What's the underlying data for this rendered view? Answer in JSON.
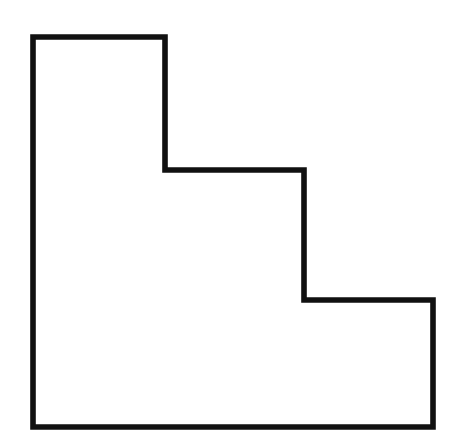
{
  "figure": {
    "name": "staircase-polygon",
    "shape_type": "polygon",
    "vertex_count": 8,
    "closed": true,
    "background_color": "#ffffff",
    "stroke_color": "#111111",
    "fill_color": "#ffffff",
    "stroke_width": 5.6,
    "canvas": {
      "width": 458,
      "height": 448
    },
    "vertices": [
      {
        "label": "top-left",
        "x": 33,
        "y": 37
      },
      {
        "label": "top-right",
        "x": 165,
        "y": 37
      },
      {
        "label": "step-1-inner",
        "x": 165,
        "y": 170
      },
      {
        "label": "step-1-right",
        "x": 304,
        "y": 170
      },
      {
        "label": "step-2-inner",
        "x": 304,
        "y": 300
      },
      {
        "label": "step-2-right",
        "x": 433,
        "y": 300
      },
      {
        "label": "bottom-right",
        "x": 433,
        "y": 427
      },
      {
        "label": "bottom-left",
        "x": 33,
        "y": 427
      }
    ],
    "path": "M 33 37 L 165 37 L 165 170 L 304 170 L 304 300 L 433 300 L 433 427 L 33 427 Z",
    "edges": [
      {
        "name": "top-edge",
        "orientation": "horizontal",
        "length": 132
      },
      {
        "name": "upper-right-edge",
        "orientation": "vertical",
        "length": 133
      },
      {
        "name": "step-1-tread",
        "orientation": "horizontal",
        "length": 139
      },
      {
        "name": "step-1-riser",
        "orientation": "vertical",
        "length": 130
      },
      {
        "name": "step-2-tread",
        "orientation": "horizontal",
        "length": 129
      },
      {
        "name": "step-2-riser",
        "orientation": "vertical",
        "length": 127
      },
      {
        "name": "bottom-edge",
        "orientation": "horizontal",
        "length": 400
      },
      {
        "name": "left-edge",
        "orientation": "vertical",
        "length": 390
      }
    ]
  }
}
